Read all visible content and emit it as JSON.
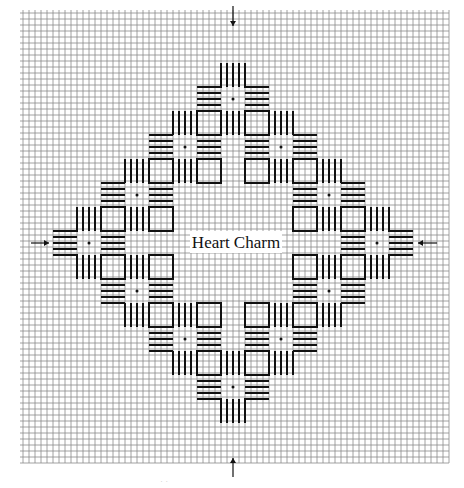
{
  "figure": {
    "title": "Heart Charm",
    "type": "needlepoint stitch chart",
    "colors": {
      "grid": "#8a8a8a",
      "stitch": "#111111",
      "background": "#ffffff"
    },
    "grid": {
      "columns": 71,
      "rows": 75
    },
    "motif": {
      "layout": "diamond ring",
      "motifs_per_side": 4,
      "center_marks": [
        "top",
        "right",
        "bottom",
        "left"
      ],
      "center_mark_icon": "arrow-icon",
      "stitch_count_per_group": 5,
      "square_cells": 4,
      "motif_step_cells": 8
    },
    "footer_note": "· ·"
  }
}
